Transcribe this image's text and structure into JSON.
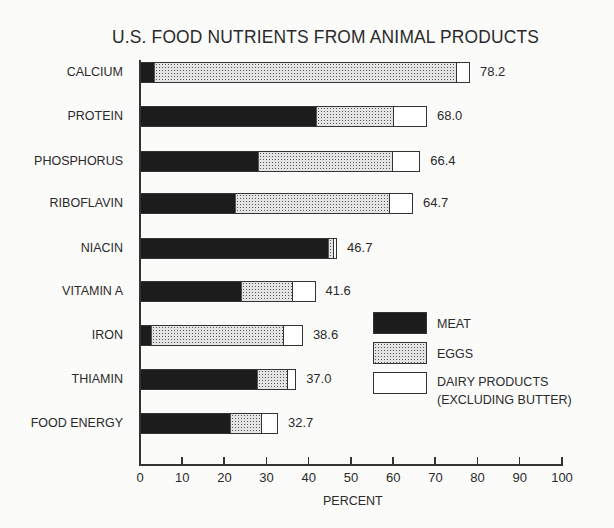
{
  "chart_data": {
    "type": "bar",
    "orientation": "horizontal",
    "stacked": true,
    "title": "U.S. FOOD NUTRIENTS FROM ANIMAL PRODUCTS",
    "xlabel": "PERCENT",
    "ylabel": "",
    "xlim": [
      0,
      100
    ],
    "x_ticks": [
      0,
      10,
      20,
      30,
      40,
      50,
      60,
      70,
      80,
      90,
      100
    ],
    "grid": false,
    "legend_position": "lower right (inside plot)",
    "categories": [
      "CALCIUM",
      "PROTEIN",
      "PHOSPHORUS",
      "RIBOFLAVIN",
      "NIACIN",
      "VITAMIN A",
      "IRON",
      "THIAMIN",
      "FOOD ENERGY"
    ],
    "series": [
      {
        "name": "MEAT",
        "pattern": "solid black",
        "values": [
          3.1,
          41.7,
          27.9,
          22.5,
          44.8,
          23.9,
          2.4,
          27.9,
          21.3
        ]
      },
      {
        "name": "EGGS",
        "pattern": "stippled gray",
        "values": [
          72.0,
          18.5,
          32.1,
          36.7,
          1.2,
          12.3,
          31.7,
          7.1,
          7.6
        ]
      },
      {
        "name": "DAIRY PRODUCTS (EXCLUDING BUTTER)",
        "pattern": "white",
        "values": [
          3.1,
          7.8,
          6.4,
          5.5,
          0.7,
          5.4,
          4.5,
          2.0,
          3.8
        ]
      }
    ],
    "totals": [
      78.2,
      68.0,
      66.4,
      64.7,
      46.7,
      41.6,
      38.6,
      37.0,
      32.7
    ],
    "total_labels": [
      "78.2",
      "68.0",
      "66.4",
      "64.7",
      "46.7",
      "41.6",
      "38.6",
      "37.0",
      "32.7"
    ]
  },
  "legend": {
    "meat": "MEAT",
    "eggs": "EGGS",
    "dairy_line1": "DAIRY PRODUCTS",
    "dairy_line2": "(EXCLUDING BUTTER)"
  },
  "colors": {
    "meat": "#1c1c1c",
    "eggs": "#e4e4e4",
    "dairy": "#ffffff",
    "ink": "#2a2a2a",
    "background": "#fbfbfa"
  }
}
